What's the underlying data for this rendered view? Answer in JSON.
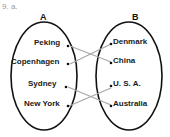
{
  "question_label": "9. a.",
  "sets": [
    {
      "name": "A",
      "elements": [
        "Peking",
        "Copenhagen",
        "Sydney",
        "New York"
      ]
    },
    {
      "name": "B",
      "elements": [
        "Denmark",
        "China",
        "U. S. A.",
        "Australia"
      ]
    }
  ],
  "mapping": [
    {
      "from": "Peking",
      "to": "China"
    },
    {
      "from": "Copenhagen",
      "to": "Denmark"
    },
    {
      "from": "Sydney",
      "to": "Australia"
    },
    {
      "from": "New York",
      "to": "U. S. A."
    }
  ],
  "colors": {
    "outline": "#111111",
    "arrow": "#a8a8a8",
    "question": "#9a9a9a"
  }
}
